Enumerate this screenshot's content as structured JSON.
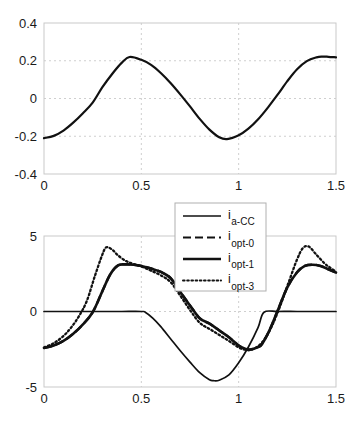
{
  "figure": {
    "background": "#ffffff",
    "line_color": "#111111",
    "grid_color": "#cfcfcf",
    "axis_color": "#c9c9c9"
  },
  "chart_data": [
    {
      "type": "line",
      "id": "top-panel",
      "title": "",
      "xlabel": "",
      "ylabel": "",
      "xlim": [
        0,
        1.5
      ],
      "ylim": [
        -0.4,
        0.4
      ],
      "xticks": [
        0,
        0.5,
        1,
        1.5
      ],
      "xticklabels": [
        "0",
        "0.5",
        "1",
        "1.5"
      ],
      "yticks": [
        -0.4,
        -0.2,
        0,
        0.2,
        0.4
      ],
      "yticklabels": [
        "-0.4",
        "-0.2",
        "0",
        "0.2",
        "0.4"
      ],
      "grid": true,
      "legend": null,
      "series": [
        {
          "name": "v",
          "style": "solid",
          "width": 2.2,
          "color": "#111111",
          "x": [
            0.0,
            0.05,
            0.1,
            0.15,
            0.2,
            0.25,
            0.3,
            0.35,
            0.4,
            0.44,
            0.5,
            0.55,
            0.6,
            0.65,
            0.7,
            0.75,
            0.8,
            0.85,
            0.9,
            0.94,
            1.0,
            1.05,
            1.1,
            1.15,
            1.2,
            1.25,
            1.3,
            1.35,
            1.4,
            1.43,
            1.46,
            1.5
          ],
          "y": [
            -0.21,
            -0.198,
            -0.17,
            -0.128,
            -0.078,
            -0.022,
            0.06,
            0.13,
            0.19,
            0.22,
            0.205,
            0.178,
            0.135,
            0.082,
            0.022,
            -0.042,
            -0.108,
            -0.165,
            -0.205,
            -0.215,
            -0.195,
            -0.16,
            -0.11,
            -0.048,
            0.02,
            0.092,
            0.155,
            0.198,
            0.218,
            0.222,
            0.221,
            0.218
          ]
        }
      ]
    },
    {
      "type": "line",
      "id": "bottom-panel",
      "title": "",
      "xlabel": "",
      "ylabel": "",
      "xlim": [
        0,
        1.5
      ],
      "ylim": [
        -5,
        5
      ],
      "xticks": [
        0,
        0.5,
        1,
        1.5
      ],
      "xticklabels": [
        "0",
        "0.5",
        "1",
        "1.5"
      ],
      "yticks": [
        -5,
        0,
        5
      ],
      "yticklabels": [
        "-5",
        "0",
        "5"
      ],
      "grid": true,
      "legend": {
        "position": "top-center",
        "entries": [
          {
            "base": "i",
            "sub": "a-CC",
            "style": "solid-thin",
            "width": 1.6
          },
          {
            "base": "i",
            "sub": "opt-0",
            "style": "dashed",
            "width": 2.0
          },
          {
            "base": "i",
            "sub": "opt-1",
            "style": "solid-thick",
            "width": 2.6
          },
          {
            "base": "i",
            "sub": "opt-3",
            "style": "dotted",
            "width": 2.0
          }
        ]
      },
      "series": [
        {
          "name": "i_a-CC",
          "style": "solid-thin",
          "width": 1.7,
          "color": "#111111",
          "x": [
            0.0,
            0.1,
            0.2,
            0.3,
            0.4,
            0.5,
            0.52,
            0.56,
            0.6,
            0.65,
            0.7,
            0.75,
            0.8,
            0.85,
            0.87,
            0.9,
            0.95,
            1.0,
            1.05,
            1.1,
            1.13,
            1.2,
            1.3,
            1.4,
            1.5
          ],
          "y": [
            0.0,
            0.0,
            0.0,
            0.0,
            0.0,
            0.0,
            -0.05,
            -0.45,
            -1.0,
            -1.8,
            -2.6,
            -3.35,
            -4.05,
            -4.52,
            -4.58,
            -4.55,
            -4.2,
            -3.4,
            -2.35,
            -1.05,
            -0.05,
            0.0,
            0.0,
            0.0,
            0.0
          ]
        },
        {
          "name": "i_opt-0",
          "style": "dashed",
          "width": 2.4,
          "color": "#111111",
          "x": [
            0.0,
            0.05,
            0.1,
            0.15,
            0.2,
            0.25,
            0.3,
            0.34,
            0.38,
            0.42,
            0.46,
            0.5,
            0.55,
            0.6,
            0.65,
            0.7,
            0.75,
            0.8,
            0.85,
            0.9,
            0.95,
            1.0,
            1.03,
            1.06,
            1.1,
            1.12,
            1.16,
            1.2,
            1.25,
            1.3,
            1.34,
            1.38,
            1.42,
            1.46,
            1.5
          ],
          "y": [
            -2.42,
            -2.25,
            -1.95,
            -1.48,
            -0.85,
            -0.05,
            1.35,
            2.45,
            3.05,
            3.12,
            3.1,
            3.02,
            2.85,
            2.62,
            2.22,
            1.3,
            0.4,
            -0.45,
            -0.8,
            -1.25,
            -1.7,
            -2.25,
            -2.45,
            -2.52,
            -2.35,
            -2.15,
            -1.2,
            0.05,
            1.6,
            2.6,
            3.02,
            3.1,
            3.02,
            2.8,
            2.58
          ]
        },
        {
          "name": "i_opt-1",
          "style": "solid-thick",
          "width": 2.6,
          "color": "#111111",
          "x": [
            0.0,
            0.05,
            0.1,
            0.15,
            0.2,
            0.25,
            0.3,
            0.34,
            0.38,
            0.42,
            0.46,
            0.5,
            0.55,
            0.6,
            0.65,
            0.7,
            0.75,
            0.8,
            0.85,
            0.9,
            0.95,
            1.0,
            1.03,
            1.06,
            1.1,
            1.12,
            1.16,
            1.2,
            1.25,
            1.3,
            1.34,
            1.38,
            1.42,
            1.46,
            1.5
          ],
          "y": [
            -2.42,
            -2.25,
            -1.95,
            -1.48,
            -0.85,
            -0.05,
            1.35,
            2.45,
            3.05,
            3.12,
            3.1,
            3.02,
            2.85,
            2.62,
            2.22,
            1.3,
            0.4,
            -0.45,
            -0.8,
            -1.25,
            -1.7,
            -2.25,
            -2.45,
            -2.52,
            -2.35,
            -2.15,
            -1.2,
            0.05,
            1.6,
            2.6,
            3.02,
            3.1,
            3.02,
            2.8,
            2.58
          ]
        },
        {
          "name": "i_opt-3",
          "style": "dotted",
          "width": 2.3,
          "color": "#111111",
          "x": [
            0.0,
            0.05,
            0.1,
            0.14,
            0.18,
            0.22,
            0.26,
            0.3,
            0.32,
            0.35,
            0.38,
            0.42,
            0.46,
            0.5,
            0.55,
            0.6,
            0.65,
            0.7,
            0.75,
            0.8,
            0.85,
            0.9,
            0.95,
            1.0,
            1.03,
            1.06,
            1.1,
            1.14,
            1.18,
            1.22,
            1.26,
            1.3,
            1.33,
            1.36,
            1.4,
            1.44,
            1.47,
            1.5
          ],
          "y": [
            -2.38,
            -2.1,
            -1.62,
            -1.05,
            -0.3,
            0.7,
            2.3,
            3.78,
            4.25,
            4.1,
            3.72,
            3.35,
            3.15,
            2.98,
            2.7,
            2.4,
            1.95,
            1.05,
            0.1,
            -0.75,
            -1.15,
            -1.55,
            -1.95,
            -2.38,
            -2.52,
            -2.55,
            -2.3,
            -1.7,
            -0.7,
            0.6,
            2.05,
            3.45,
            4.2,
            4.3,
            3.75,
            3.2,
            2.9,
            2.65
          ]
        }
      ]
    }
  ]
}
